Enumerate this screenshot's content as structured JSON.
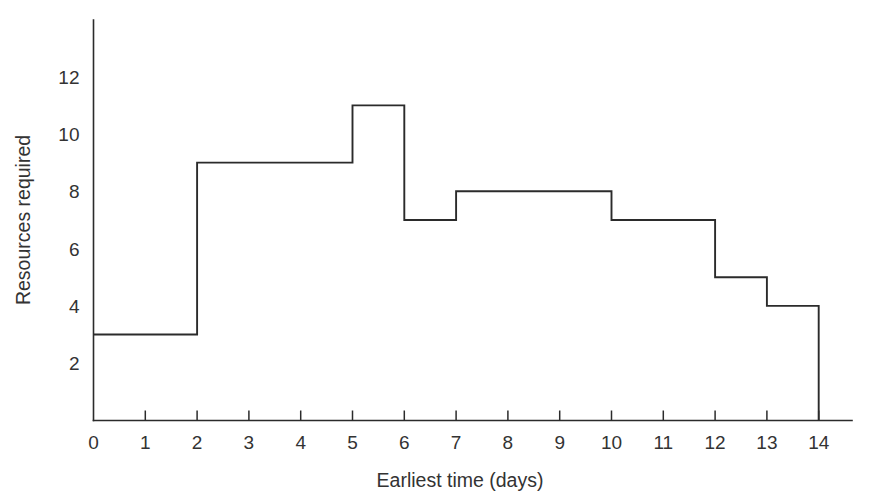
{
  "chart_data": {
    "type": "area",
    "title": "",
    "subtitle": "",
    "xlabel": "Earliest time (days)",
    "ylabel": "Resources required",
    "xlim": [
      0,
      14
    ],
    "ylim": [
      0,
      13.8
    ],
    "grid": false,
    "legend": null,
    "x_ticks": [
      "0",
      "1",
      "2",
      "3",
      "4",
      "5",
      "6",
      "7",
      "8",
      "9",
      "10",
      "11",
      "12",
      "13",
      "14"
    ],
    "x_tick_values": [
      0,
      1,
      2,
      3,
      4,
      5,
      6,
      7,
      8,
      9,
      10,
      11,
      12,
      13,
      14
    ],
    "y_ticks": [
      "2",
      "4",
      "6",
      "8",
      "10",
      "12"
    ],
    "y_tick_values": [
      2,
      4,
      6,
      8,
      10,
      12
    ],
    "series": [
      {
        "name": "Resources required",
        "style": "step-post",
        "color": "#2b2b2b",
        "steps": [
          {
            "x_start": 0,
            "x_end": 2,
            "value": 3
          },
          {
            "x_start": 2,
            "x_end": 5,
            "value": 9
          },
          {
            "x_start": 5,
            "x_end": 6,
            "value": 11
          },
          {
            "x_start": 6,
            "x_end": 7,
            "value": 7
          },
          {
            "x_start": 7,
            "x_end": 10,
            "value": 8
          },
          {
            "x_start": 10,
            "x_end": 12,
            "value": 7
          },
          {
            "x_start": 12,
            "x_end": 13,
            "value": 5
          },
          {
            "x_start": 13,
            "x_end": 14,
            "value": 4
          }
        ],
        "x": [
          0,
          2,
          2,
          5,
          5,
          6,
          6,
          7,
          7,
          10,
          10,
          12,
          12,
          13,
          13,
          14,
          14
        ],
        "y": [
          3,
          3,
          9,
          9,
          11,
          11,
          7,
          7,
          8,
          8,
          7,
          7,
          5,
          5,
          4,
          4,
          0
        ]
      }
    ]
  },
  "axes": {
    "x_axis_title": "Earliest time (days)",
    "y_axis_title": "Resources required"
  },
  "colors": {
    "line": "#2b2b2b",
    "axis": "#2b2b2b",
    "text": "#333333",
    "background": "#ffffff"
  }
}
